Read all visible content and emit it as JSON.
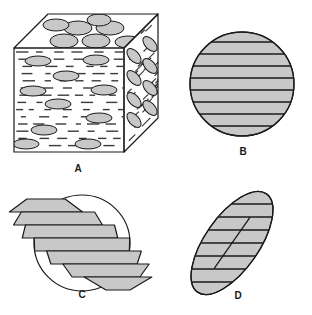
{
  "figure": {
    "background": "#ffffff",
    "panel_count": 4
  },
  "style": {
    "inclusion_fill": "#c8c8c8",
    "face_fill": "#ffffff",
    "stroke": "#1a1a1a",
    "matrix_dash": "#3a3a3a",
    "stroke_width": 1
  },
  "panels": [
    {
      "id": "A",
      "label": "A",
      "label_x": 78,
      "label_y": 172,
      "name": "cube-3d-composite-block",
      "description": "Three dimensional block with oriented ellipsoidal inclusions shown on top, front and right faces",
      "faces": [
        "top",
        "front",
        "right"
      ],
      "geometry": {
        "front": "14,48 14,152 124,152 124,48",
        "top": "14,48 48,14 158,14 124,48",
        "right": "124,48 158,14 158,118 124,152"
      },
      "top_ellipses": [
        {
          "cx": 64,
          "cy": 41,
          "rx": 14,
          "ry": 7
        },
        {
          "cx": 96,
          "cy": 41,
          "rx": 14,
          "ry": 7
        },
        {
          "cx": 78,
          "cy": 28,
          "rx": 14,
          "ry": 7
        },
        {
          "cx": 110,
          "cy": 28,
          "rx": 14,
          "ry": 7
        },
        {
          "cx": 56,
          "cy": 25,
          "rx": 13,
          "ry": 6
        },
        {
          "cx": 128,
          "cy": 42,
          "rx": 13,
          "ry": 6
        },
        {
          "cx": 99,
          "cy": 20,
          "rx": 12,
          "ry": 6
        }
      ],
      "front_ellipses": [
        {
          "cx": 38,
          "cy": 61,
          "rx": 13,
          "ry": 5
        },
        {
          "cx": 96,
          "cy": 60,
          "rx": 13,
          "ry": 5
        },
        {
          "cx": 66,
          "cy": 76,
          "rx": 13,
          "ry": 5
        },
        {
          "cx": 33,
          "cy": 91,
          "rx": 13,
          "ry": 5
        },
        {
          "cx": 104,
          "cy": 90,
          "rx": 13,
          "ry": 5
        },
        {
          "cx": 58,
          "cy": 104,
          "rx": 13,
          "ry": 5
        },
        {
          "cx": 99,
          "cy": 118,
          "rx": 13,
          "ry": 5
        },
        {
          "cx": 44,
          "cy": 130,
          "rx": 13,
          "ry": 5
        },
        {
          "cx": 26,
          "cy": 144,
          "rx": 13,
          "ry": 5
        },
        {
          "cx": 88,
          "cy": 144,
          "rx": 13,
          "ry": 5
        }
      ],
      "right_ellipses": [
        {
          "cx": 134,
          "cy": 56,
          "rx": 5,
          "ry": 9
        },
        {
          "cx": 150,
          "cy": 44,
          "rx": 5,
          "ry": 9
        },
        {
          "cx": 134,
          "cy": 78,
          "rx": 5,
          "ry": 9
        },
        {
          "cx": 150,
          "cy": 66,
          "rx": 5,
          "ry": 9
        },
        {
          "cx": 134,
          "cy": 100,
          "rx": 5,
          "ry": 9
        },
        {
          "cx": 150,
          "cy": 88,
          "rx": 5,
          "ry": 9
        },
        {
          "cx": 134,
          "cy": 120,
          "rx": 5,
          "ry": 9
        },
        {
          "cx": 150,
          "cy": 108,
          "rx": 5,
          "ry": 9
        }
      ]
    },
    {
      "id": "B",
      "label": "B",
      "label_x": 243,
      "label_y": 155,
      "name": "circular-cross-section",
      "description": "Circular section normal to the inclusion plane, filled grey with horizontal layer lines",
      "circle": {
        "cx": 242,
        "cy": 84,
        "r": 52
      },
      "line_count": 8,
      "line_spacing": 12
    },
    {
      "id": "C",
      "label": "C",
      "label_x": 82,
      "label_y": 298,
      "name": "sheared-slab-stack",
      "description": "Exploded stack of offset slab slices over a circle outline, illustrating shear displacement between layers",
      "base_circle": {
        "cx": 82,
        "cy": 243,
        "r": 48
      },
      "slab_count": 7,
      "slab_offset_x": 12,
      "slab_height": 13
    },
    {
      "id": "D",
      "label": "D",
      "label_x": 238,
      "label_y": 299,
      "name": "tilted-elliptical-section",
      "description": "Oblique elliptical section, grey filled with horizontal trace lines and a major axis line",
      "ellipse": {
        "cx": 232,
        "cy": 243,
        "rx": 60,
        "ry": 27,
        "rotation_deg": -55
      },
      "line_count": 7,
      "line_spacing": 13
    }
  ]
}
